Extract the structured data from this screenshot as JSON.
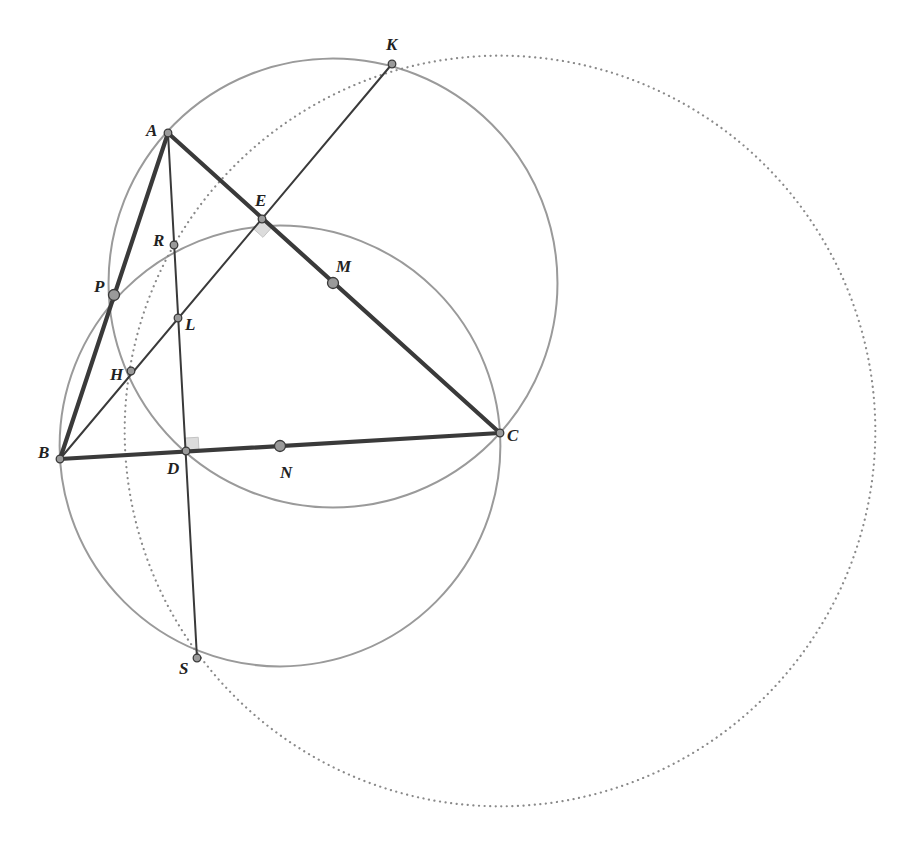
{
  "diagram": {
    "type": "geometry-construction",
    "colors": {
      "triangle": "#3a3a3a",
      "line": "#3a3a3a",
      "circle": "#9a9a9a",
      "dotted_circle": "#8a8a8a",
      "point_fill": "#9a9a9a",
      "point_stroke": "#3a3a3a",
      "right_angle_fill": "#dcdcdc"
    },
    "points": [
      {
        "id": "A",
        "label": "A",
        "x": 168,
        "y": 133,
        "size": "small"
      },
      {
        "id": "B",
        "label": "B",
        "x": 60,
        "y": 459,
        "size": "small"
      },
      {
        "id": "C",
        "label": "C",
        "x": 500,
        "y": 433,
        "size": "small"
      },
      {
        "id": "K",
        "label": "K",
        "x": 392,
        "y": 64,
        "size": "small"
      },
      {
        "id": "E",
        "label": "E",
        "x": 262,
        "y": 219,
        "size": "small"
      },
      {
        "id": "R",
        "label": "R",
        "x": 174,
        "y": 245,
        "size": "small"
      },
      {
        "id": "M",
        "label": "M",
        "x": 333,
        "y": 283,
        "size": "large"
      },
      {
        "id": "P",
        "label": "P",
        "x": 114,
        "y": 295,
        "size": "large"
      },
      {
        "id": "L",
        "label": "L",
        "x": 178,
        "y": 318,
        "size": "small"
      },
      {
        "id": "H",
        "label": "H",
        "x": 131,
        "y": 371,
        "size": "small"
      },
      {
        "id": "D",
        "label": "D",
        "x": 186,
        "y": 451,
        "size": "small"
      },
      {
        "id": "N",
        "label": "N",
        "x": 280,
        "y": 446,
        "size": "large"
      },
      {
        "id": "S",
        "label": "S",
        "x": 197,
        "y": 658,
        "size": "small"
      }
    ],
    "labels": [
      {
        "text": "A",
        "x": 146,
        "y": 136
      },
      {
        "text": "B",
        "x": 38,
        "y": 458
      },
      {
        "text": "C",
        "x": 507,
        "y": 441
      },
      {
        "text": "K",
        "x": 386,
        "y": 50
      },
      {
        "text": "E",
        "x": 255,
        "y": 206
      },
      {
        "text": "R",
        "x": 153,
        "y": 246
      },
      {
        "text": "M",
        "x": 336,
        "y": 272
      },
      {
        "text": "P",
        "x": 94,
        "y": 292
      },
      {
        "text": "L",
        "x": 185,
        "y": 330
      },
      {
        "text": "H",
        "x": 110,
        "y": 380
      },
      {
        "text": "D",
        "x": 167,
        "y": 474
      },
      {
        "text": "N",
        "x": 280,
        "y": 478
      },
      {
        "text": "S",
        "x": 179,
        "y": 674
      }
    ],
    "segments": [
      {
        "name": "side-ab",
        "from": "A",
        "to": "B",
        "weight": "thick"
      },
      {
        "name": "side-ac",
        "from": "A",
        "to": "C",
        "weight": "thick"
      },
      {
        "name": "side-bc",
        "from": "B",
        "to": "C",
        "weight": "thick"
      },
      {
        "name": "line-bk",
        "from": "B",
        "to": "K",
        "weight": "thin"
      },
      {
        "name": "line-as",
        "from": "A",
        "to": "S",
        "weight": "thin"
      }
    ],
    "circles": [
      {
        "name": "circle-diameter-ac",
        "center": "M",
        "through": "C",
        "style": "solid"
      },
      {
        "name": "circle-diameter-bc",
        "center": "N",
        "through": "B",
        "style": "solid"
      },
      {
        "name": "circle-krhs",
        "cx": 500,
        "cy": 431,
        "through": "R",
        "style": "dotted"
      }
    ],
    "right_angles": [
      {
        "name": "right-angle-e",
        "vertex": "E",
        "dir1": "C",
        "dir2": "B"
      },
      {
        "name": "right-angle-d",
        "vertex": "D",
        "dir1": "C",
        "dir2": "A"
      }
    ]
  }
}
